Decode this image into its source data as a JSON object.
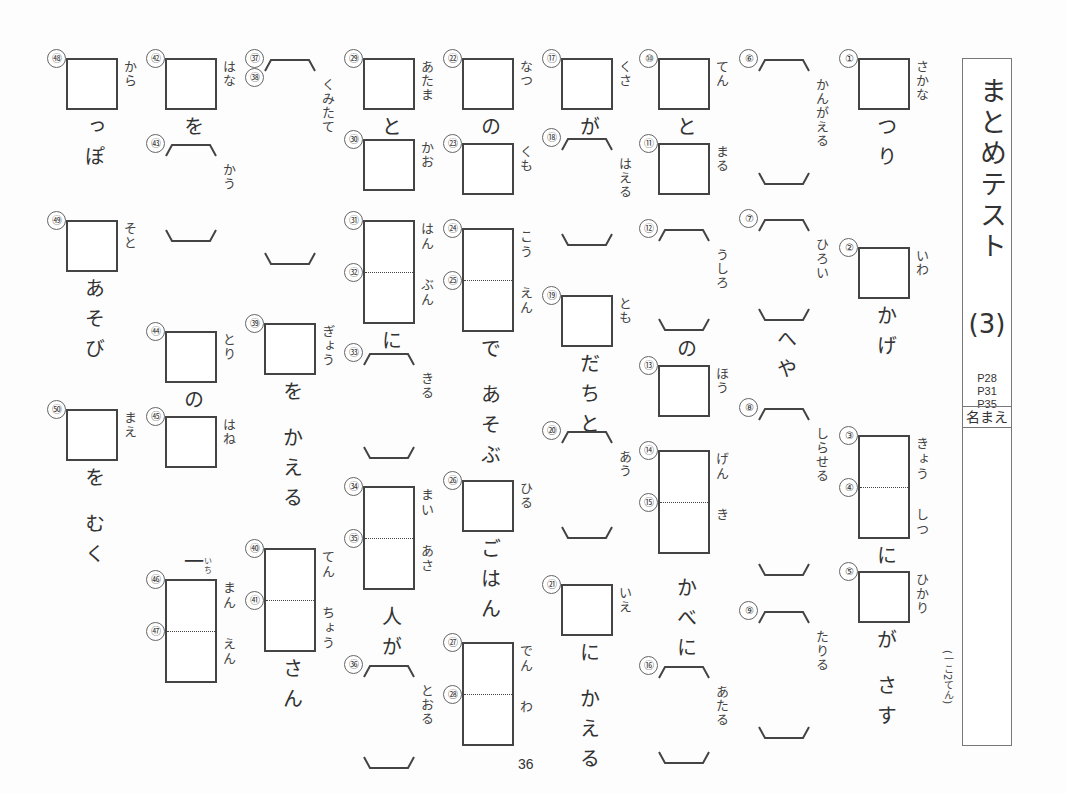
{
  "title": "まとめテスト",
  "title_number": "(3)",
  "page_refs": [
    "P28",
    "P31",
    "P35"
  ],
  "name_label": "名まえ",
  "points_note": "(一こ2てん)",
  "page_number": "36",
  "items": [
    {
      "col": 0,
      "type": "box",
      "nums": [
        "①"
      ],
      "ruby": "さかな",
      "y": 58,
      "h": 52,
      "after": "つり"
    },
    {
      "col": 0,
      "type": "box",
      "nums": [
        "②"
      ],
      "ruby": "いわ",
      "y": 247,
      "h": 52,
      "after": "かげ"
    },
    {
      "col": 0,
      "type": "box2",
      "nums": [
        "③",
        "④"
      ],
      "ruby": "きょう しつ",
      "y": 435,
      "h": 104,
      "after": "に"
    },
    {
      "col": 0,
      "type": "box",
      "nums": [
        "⑤"
      ],
      "ruby": "ひかり",
      "y": 571,
      "h": 52,
      "after": "が さす"
    },
    {
      "col": 1,
      "type": "bracket",
      "nums": [
        "⑥"
      ],
      "ruby": "かんがえる",
      "y": 58,
      "h": 128
    },
    {
      "col": 1,
      "type": "bracket",
      "nums": [
        "⑦"
      ],
      "ruby": "ひろい",
      "y": 218,
      "h": 104,
      "after": "へや"
    },
    {
      "col": 1,
      "type": "bracket",
      "nums": [
        "⑧"
      ],
      "ruby": "しらせる",
      "y": 407,
      "h": 170
    },
    {
      "col": 1,
      "type": "bracket",
      "nums": [
        "⑨"
      ],
      "ruby": "たりる",
      "y": 610,
      "h": 130
    },
    {
      "col": 2,
      "type": "box",
      "nums": [
        "⑩"
      ],
      "ruby": "てん",
      "y": 58,
      "h": 52,
      "after": "と"
    },
    {
      "col": 2,
      "type": "box",
      "nums": [
        "⑪"
      ],
      "ruby": "まる",
      "y": 143,
      "h": 52
    },
    {
      "col": 2,
      "type": "bracket",
      "nums": [
        "⑫"
      ],
      "ruby": "うしろ",
      "y": 228,
      "h": 104,
      "after": "の"
    },
    {
      "col": 2,
      "type": "box",
      "nums": [
        "⑬"
      ],
      "ruby": "ほう",
      "y": 365,
      "h": 52
    },
    {
      "col": 2,
      "type": "box2",
      "nums": [
        "⑭",
        "⑮"
      ],
      "ruby": "げん き",
      "y": 450,
      "h": 104
    },
    {
      "col": 2,
      "type": "bracket",
      "nums": [
        "⑯"
      ],
      "ruby": "あたる",
      "y": 665,
      "h": 100,
      "before": "かべに"
    },
    {
      "col": 3,
      "type": "box",
      "nums": [
        "⑰"
      ],
      "ruby": "くさ",
      "y": 58,
      "h": 52,
      "after": "が"
    },
    {
      "col": 3,
      "type": "bracket",
      "nums": [
        "⑱"
      ],
      "ruby": "はえる",
      "y": 137,
      "h": 110
    },
    {
      "col": 3,
      "type": "box",
      "nums": [
        "⑲"
      ],
      "ruby": "とも",
      "y": 295,
      "h": 52,
      "after": "だちと"
    },
    {
      "col": 3,
      "type": "bracket",
      "nums": [
        "⑳"
      ],
      "ruby": "あう",
      "y": 430,
      "h": 110
    },
    {
      "col": 3,
      "type": "box",
      "nums": [
        "㉑"
      ],
      "ruby": "いえ",
      "y": 584,
      "h": 52,
      "after": "に かえる"
    },
    {
      "col": 4,
      "type": "box",
      "nums": [
        "㉒"
      ],
      "ruby": "なつ",
      "y": 58,
      "h": 52,
      "after": "の"
    },
    {
      "col": 4,
      "type": "box",
      "nums": [
        "㉓"
      ],
      "ruby": "くも",
      "y": 143,
      "h": 52
    },
    {
      "col": 4,
      "type": "box2",
      "nums": [
        "㉔",
        "㉕"
      ],
      "ruby": "こう えん",
      "y": 228,
      "h": 104,
      "after": "で あそぶ"
    },
    {
      "col": 4,
      "type": "box",
      "nums": [
        "㉖"
      ],
      "ruby": "ひる",
      "y": 480,
      "h": 52,
      "after": "ごはん"
    },
    {
      "col": 4,
      "type": "box2",
      "nums": [
        "㉗",
        "㉘"
      ],
      "ruby": "でん わ",
      "y": 642,
      "h": 104
    },
    {
      "col": 5,
      "type": "box",
      "nums": [
        "㉙"
      ],
      "ruby": "あたま",
      "y": 58,
      "h": 52,
      "after": "と"
    },
    {
      "col": 5,
      "type": "box",
      "nums": [
        "㉚"
      ],
      "ruby": "かお",
      "y": 139,
      "h": 52
    },
    {
      "col": 5,
      "type": "box2",
      "nums": [
        "㉛",
        "㉜"
      ],
      "ruby": "はん ぶん",
      "y": 220,
      "h": 104,
      "after": "に"
    },
    {
      "col": 5,
      "type": "bracket",
      "nums": [
        "㉝"
      ],
      "ruby": "きる",
      "y": 352,
      "h": 108
    },
    {
      "col": 5,
      "type": "box2",
      "nums": [
        "㉞",
        "㉟"
      ],
      "ruby": "まい あさ",
      "y": 486,
      "h": 104
    },
    {
      "col": 5,
      "type": "bracket",
      "nums": [
        "㊱"
      ],
      "ruby": "とおる",
      "y": 664,
      "h": 106,
      "before": "人が"
    },
    {
      "col": 6,
      "type": "bracket",
      "nums": [
        "㊲",
        "㊳"
      ],
      "ruby": "くみたて",
      "y": 58,
      "h": 208
    },
    {
      "col": 6,
      "type": "box",
      "nums": [
        "㊴"
      ],
      "ruby": "ぎょう",
      "y": 323,
      "h": 52,
      "after": "を かえる"
    },
    {
      "col": 6,
      "type": "box2",
      "nums": [
        "㊵",
        "㊶"
      ],
      "ruby": "てん ちょう",
      "y": 548,
      "h": 104,
      "after": "さん"
    },
    {
      "col": 7,
      "type": "box",
      "nums": [
        "㊷"
      ],
      "ruby": "はな",
      "y": 58,
      "h": 52,
      "after": "を"
    },
    {
      "col": 7,
      "type": "bracket",
      "nums": [
        "㊸"
      ],
      "ruby": "かう",
      "y": 143,
      "h": 100
    },
    {
      "col": 7,
      "type": "box",
      "nums": [
        "㊹"
      ],
      "ruby": "とり",
      "y": 331,
      "h": 52,
      "after": "の"
    },
    {
      "col": 7,
      "type": "box",
      "nums": [
        "㊺"
      ],
      "ruby": "はね",
      "y": 416,
      "h": 52
    },
    {
      "col": 7,
      "type": "box2",
      "nums": [
        "㊻",
        "㊼"
      ],
      "ruby": "まん えん",
      "y": 579,
      "h": 104,
      "before": "一",
      "before_ruby": "いち"
    },
    {
      "col": 8,
      "type": "box",
      "nums": [
        "㊽"
      ],
      "ruby": "から",
      "y": 58,
      "h": 52,
      "after": "っぽ"
    },
    {
      "col": 8,
      "type": "box",
      "nums": [
        "㊾"
      ],
      "ruby": "そと",
      "y": 220,
      "h": 52,
      "after": "あそび"
    },
    {
      "col": 8,
      "type": "box",
      "nums": [
        "㊿"
      ],
      "ruby": "まえ",
      "y": 409,
      "h": 52,
      "after": "を むく"
    }
  ]
}
